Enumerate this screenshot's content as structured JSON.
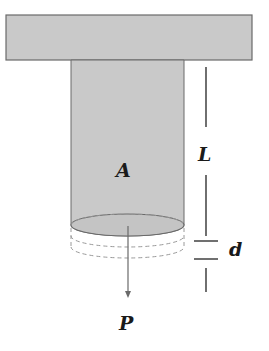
{
  "figure": {
    "type": "axial-load-column-elongation",
    "labels": {
      "area": "A",
      "length": "L",
      "elongation": "d",
      "load": "P"
    },
    "colors": {
      "fill": "#c9c9c9",
      "stroke": "#5a5a5a",
      "dashed": "#8a8a8a",
      "text": "#1a1a1a"
    }
  }
}
